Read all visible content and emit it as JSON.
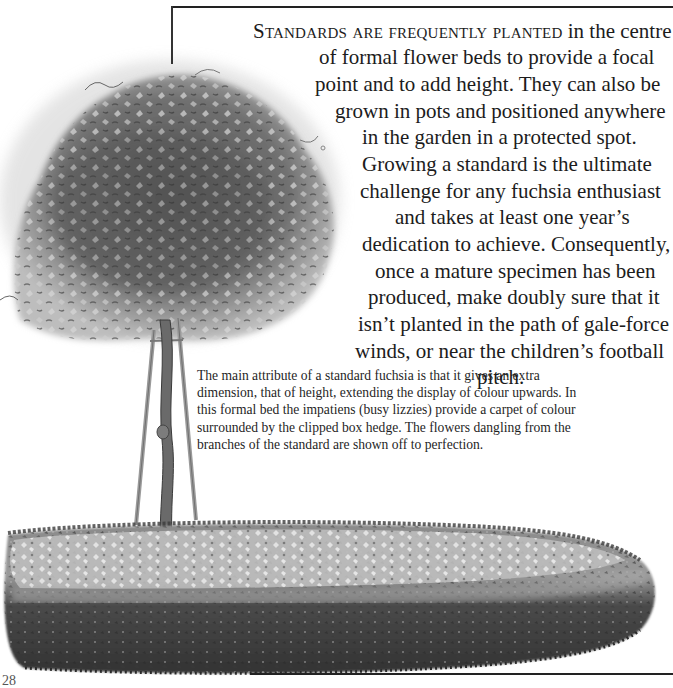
{
  "page": {
    "page_number": "28"
  },
  "main_text": {
    "lead_in": "Standards are frequently planted",
    "lines": [
      " in the centre",
      "of formal flower beds to provide a focal",
      "point and to add height. They can also be",
      "grown in pots and positioned anywhere",
      "in the garden in a protected spot.",
      "Growing a standard is the ultimate",
      "challenge for any fuchsia enthusiast",
      "and takes at least one year’s",
      "dedication to achieve. Consequently,",
      "once a mature specimen has been",
      "produced, make doubly sure that it",
      "isn’t planted in the path of gale-force",
      "winds, or near the children’s football",
      "pitch."
    ]
  },
  "caption": {
    "lines": [
      "The main attribute of a standard fuchsia is that it gives an extra",
      "dimension, that of height, extending the display of colour upwards. In",
      "this formal bed the impatiens (busy lizzies) provide a carpet of colour",
      "surrounded by the clipped box hedge. The flowers dangling from the",
      "branches of the standard are shown off to perfection."
    ]
  },
  "illustration": {
    "subject": "standard fuchsia tree in formal bed with box hedge",
    "palette": {
      "foliage_dark": "#3c3c3c",
      "foliage_mid": "#6e6e6e",
      "foliage_light": "#a8a8a8",
      "flowers": "#d8d8d8",
      "trunk": "#5a5a5a",
      "cane": "#9a9a9a",
      "hedge_dark": "#2e2e2e",
      "hedge_mid": "#666666",
      "bed_light": "#c4c4c4"
    }
  }
}
